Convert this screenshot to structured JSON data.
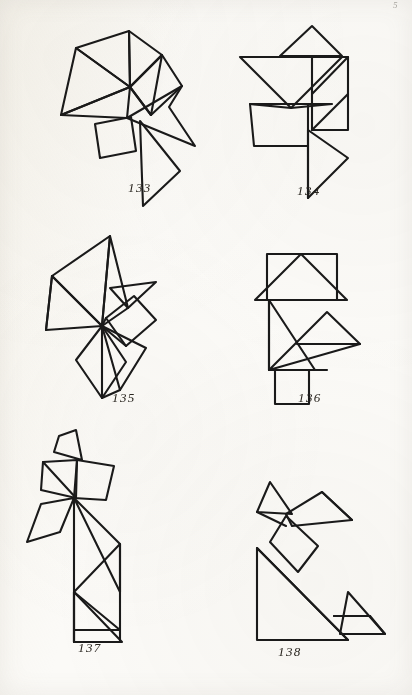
{
  "page": {
    "folio": "5",
    "background_color": "#fbfaf7",
    "ink_color": "#1a1a1a",
    "width": 412,
    "height": 695
  },
  "figures": [
    {
      "id": "fig-133",
      "caption": "133",
      "caption_x": 128,
      "caption_y": 180,
      "x": 30,
      "y": 14,
      "width": 180,
      "height": 180,
      "shape_name": "tangram-figure-133",
      "outline": "M 44 32 L 98 18 L 130 40 L 150 72 L 138 90 L 163 130 L 120 143 L 126 120 L 100 128 L 97 103 L 64 108 L 30 100 L 44 32 Z",
      "strokes": [
        "M 44 32 L 98 18 L 101 72 L 44 32 Z",
        "M 98 18 L 131 41 L 101 72 Z",
        "M 101 72 L 131 41 L 150 72 L 120 100 Z",
        "M 30 100 L 101 72 L 97 103 Z",
        "M 44 32 L 101 72 L 30 100 Z",
        "M 97 103 L 120 100 L 150 72 L 138 92 L 163 130 L 120 108 Z",
        "M 64 108 L 100 101 L 104 134 L 68 141 Z",
        "M 108 105 L 112 190 L 148 155 Z"
      ]
    },
    {
      "id": "fig-134",
      "caption": "134",
      "caption_x": 297,
      "caption_y": 183,
      "x": 228,
      "y": 14,
      "width": 170,
      "height": 182,
      "shape_name": "tangram-figure-134",
      "strokes": [
        "M 52 40 L 82 12 L 112 40 Z",
        "M 12 42 L 112 42 L 62 92 Z",
        "M 82 42 L 82 115 L 118 78 Z",
        "M 82 42 L 118 42 L 118 115 L 82 115 Z",
        "M 118 42 L 118 115 L 82 115 Z",
        "M 22 88 L 62 92 L 102 88 L 78 112 Z",
        "M 25 92 L 78 92 L 78 132 L 25 132 Z",
        "M 78 92 L 78 182 L 118 142 Z",
        "M 78 115 L 118 142 L 78 182 Z"
      ]
    },
    {
      "id": "fig-135",
      "caption": "135",
      "caption_x": 112,
      "caption_y": 390,
      "x": 22,
      "y": 228,
      "width": 170,
      "height": 176,
      "shape_name": "tangram-figure-135",
      "strokes": [
        "M 28 46 L 86 6 L 78 96 Z",
        "M 28 46 L 78 96 L 22 100 Z",
        "M 86 6 L 78 96 L 112 58 Z",
        "M 86 58 L 130 52 L 104 78 Z",
        "M 78 96 L 108 70 L 130 92 L 100 116 Z",
        "M 78 96 L 100 116 L 72 120 Z",
        "M 78 96 L 120 118 L 96 160 Z",
        "M 78 96 L 96 160 L 72 166 Z",
        "M 78 96 L 52 130 L 78 166 L 100 132 Z"
      ]
    },
    {
      "id": "fig-136",
      "caption": "136",
      "caption_x": 298,
      "caption_y": 390,
      "x": 236,
      "y": 230,
      "width": 140,
      "height": 170,
      "shape_name": "tangram-figure-136",
      "strokes": [
        "M 30 22 L 100 22 L 100 68 L 30 68 Z",
        "M 18 68 L 64 22 L 110 68 Z",
        "M 32 68 L 32 138 L 78 138 Z",
        "M 32 138 L 90 80 L 122 112 L 60 112 Z",
        "M 32 138 L 60 112 L 122 112 Z",
        "M 38 138 L 72 138 L 72 172 L 38 172 Z"
      ]
    },
    {
      "id": "fig-137",
      "caption": "137",
      "caption_x": 78,
      "caption_y": 640,
      "x": 14,
      "y": 424,
      "width": 160,
      "height": 212,
      "shape_name": "tangram-figure-137",
      "strokes": [
        "M 44 10 L 60 4 L 66 34 L 38 26 Z",
        "M 28 36 L 62 34 L 62 72 L 26 64 Z",
        "M 62 34 L 98 40 L 90 74 L 58 72 Z",
        "M 58 72 L 26 78 L 12 116 L 44 106 Z",
        "M 58 72 L 58 216 L 62 216 Z",
        "M 58 72 L 104 118 L 104 166 Z",
        "M 58 166 L 104 118 L 104 204 L 58 204 Z",
        "M 58 166 L 104 204 L 58 204 Z",
        "M 58 204 L 104 204 L 104 216 L 58 216 Z",
        "M 58 166 L 58 216 L 104 216 Z"
      ]
    },
    {
      "id": "fig-138",
      "caption": "138",
      "caption_x": 278,
      "caption_y": 644,
      "x": 228,
      "y": 462,
      "width": 170,
      "height": 178,
      "shape_name": "tangram-figure-138",
      "strokes": [
        "M 40 18 L 62 50 L 28 48 Z",
        "M 28 48 L 62 50 L 56 62 Z",
        "M 56 50 L 92 28 L 122 56 L 62 62 Z",
        "M 56 52 L 40 78 L 68 108 L 88 82 Z",
        "M 28 84 L 28 176 L 118 176 Z",
        "M 28 84 L 118 176 L 28 176 Z",
        "M 110 170 L 118 128 L 155 170 Z",
        "M 104 152 L 140 152 L 155 170 Z"
      ]
    }
  ]
}
